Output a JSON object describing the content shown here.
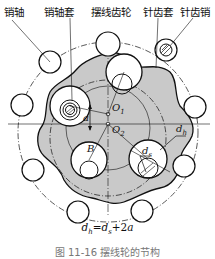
{
  "labels": {
    "pin_shaft": "销轴",
    "pin_shaft_sleeve": "销轴套",
    "cycloid_gear": "摆线齿轮",
    "needle_tooth_sleeve": "针齿套",
    "needle_tooth_pin": "针齿销"
  },
  "symbols": {
    "o1": "O",
    "o1_sub": "1",
    "o2": "O",
    "o2_sub": "2",
    "a": "a",
    "b": "B",
    "dh": "d",
    "dh_sub": "h",
    "ds": "d",
    "ds_sub": "s"
  },
  "formula": "dh=ds+2a",
  "formula_parts": {
    "d1": "d",
    "s1": "h",
    "eq": "=",
    "d2": "d",
    "s2": "s",
    "plus": "+2",
    "a": "a"
  },
  "caption": "图 11-16 摆线轮的节构",
  "colors": {
    "gear_fill": "#c9c9c9",
    "line": "#111111",
    "background": "#ffffff"
  }
}
